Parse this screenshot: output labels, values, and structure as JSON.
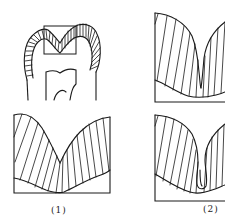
{
  "figure": {
    "type": "line-drawing",
    "stroke_color": "#1a1a1a",
    "background": "#ffffff",
    "panels": [
      {
        "id": "tooth",
        "description": "tooth crown cross-section with hatched enamel and occlusal fissure region boxed"
      },
      {
        "id": "fissure-1",
        "description": "open V-shaped fissure, hatched enamel"
      },
      {
        "id": "fissure-2-top",
        "description": "narrow deep fissure, hatched enamel"
      },
      {
        "id": "fissure-2-bottom",
        "description": "narrow fissure with bulbous base, hatched enamel"
      }
    ],
    "labels": {
      "one": "(1)",
      "two": "(2)"
    }
  }
}
